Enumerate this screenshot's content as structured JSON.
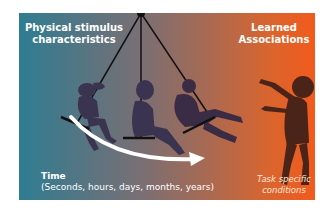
{
  "diagram": {
    "labels": {
      "left_heading": "Physical stimulus characteristics",
      "right_heading": "Learned Associations",
      "time_title": "Time",
      "time_subtitle": "(Seconds, hours, days, months, years)",
      "task_conditions": "Task specific conditions"
    },
    "figures": [
      {
        "name": "child-on-swing-back"
      },
      {
        "name": "child-on-swing-middle"
      },
      {
        "name": "child-on-swing-forward"
      },
      {
        "name": "person-reaching"
      }
    ],
    "colors": {
      "gradient_left": "#2e7d92",
      "gradient_right": "#f25a1c",
      "silhouette": "#3a2c45",
      "person_silhouette": "#4a2418",
      "arrow": "#ffffff"
    }
  }
}
